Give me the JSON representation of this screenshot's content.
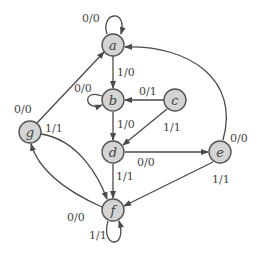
{
  "diagram": {
    "type": "finite-state-machine (Mealy)",
    "nodes": [
      {
        "id": "a",
        "label": "a",
        "x": 113,
        "y": 45
      },
      {
        "id": "b",
        "label": "b",
        "x": 113,
        "y": 100
      },
      {
        "id": "c",
        "label": "c",
        "x": 175,
        "y": 100
      },
      {
        "id": "d",
        "label": "d",
        "x": 113,
        "y": 152
      },
      {
        "id": "e",
        "label": "e",
        "x": 220,
        "y": 152
      },
      {
        "id": "f",
        "label": "f",
        "x": 113,
        "y": 210
      },
      {
        "id": "g",
        "label": "g",
        "x": 30,
        "y": 132
      }
    ],
    "edges": [
      {
        "from": "a",
        "to": "a",
        "label": "0/0"
      },
      {
        "from": "a",
        "to": "b",
        "label": "1/0"
      },
      {
        "from": "b",
        "to": "b",
        "label": "0/0"
      },
      {
        "from": "c",
        "to": "b",
        "label": "0/1"
      },
      {
        "from": "b",
        "to": "d",
        "label": "1/0"
      },
      {
        "from": "c",
        "to": "d",
        "label": "1/1"
      },
      {
        "from": "d",
        "to": "e",
        "label": "0/0"
      },
      {
        "from": "d",
        "to": "f",
        "label": "1/1"
      },
      {
        "from": "e",
        "to": "a",
        "label": "0/0"
      },
      {
        "from": "e",
        "to": "f",
        "label": "1/1"
      },
      {
        "from": "g",
        "to": "a",
        "label": "0/0"
      },
      {
        "from": "g",
        "to": "f",
        "label": "1/1"
      },
      {
        "from": "f",
        "to": "g",
        "label": "0/0"
      },
      {
        "from": "f",
        "to": "f",
        "label": "1/1"
      }
    ]
  }
}
